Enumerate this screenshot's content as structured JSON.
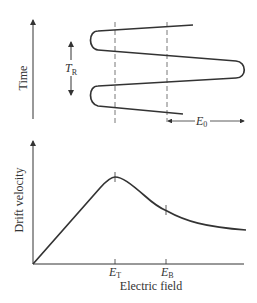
{
  "top_panel": {
    "y_label": "Time",
    "period_label": "T",
    "period_subscript": "R",
    "offset_label": "E",
    "offset_subscript": "0"
  },
  "bottom_panel": {
    "y_label": "Drift velocity",
    "x_label": "Electric field",
    "tick_labels": [
      {
        "main": "E",
        "sub": "T"
      },
      {
        "main": "E",
        "sub": "B"
      }
    ]
  },
  "colors": {
    "ink": "#333333",
    "background": "#ffffff"
  }
}
